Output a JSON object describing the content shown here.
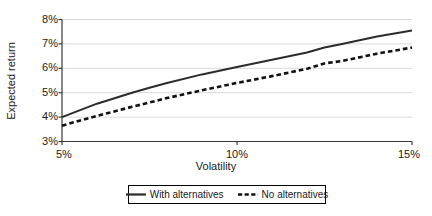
{
  "chart_data": {
    "type": "line",
    "title": "",
    "xlabel": "Volatility",
    "ylabel": "Expected return",
    "xlim": [
      5,
      15
    ],
    "ylim": [
      3,
      8
    ],
    "grid": true,
    "legend_position": "bottom",
    "x_tick_labels": [
      "5%",
      "10%",
      "15%"
    ],
    "x_ticks": [
      5,
      10,
      15
    ],
    "y_tick_labels": [
      "3%",
      "4%",
      "5%",
      "6%",
      "7%",
      "8%"
    ],
    "y_ticks": [
      3,
      4,
      5,
      6,
      7,
      8
    ],
    "x": [
      5,
      6,
      7,
      7.5,
      8,
      9,
      10,
      11,
      12,
      12.5,
      13,
      14,
      15
    ],
    "series": [
      {
        "name": "With alternatives",
        "style": "solid",
        "color": "#2b2b2b",
        "values": [
          4.0,
          4.55,
          5.0,
          5.2,
          5.4,
          5.75,
          6.05,
          6.35,
          6.65,
          6.85,
          7.0,
          7.3,
          7.55
        ]
      },
      {
        "name": "No alternatives",
        "style": "dashed",
        "color": "#111111",
        "values": [
          3.65,
          4.05,
          4.42,
          4.6,
          4.78,
          5.1,
          5.4,
          5.68,
          5.98,
          6.2,
          6.3,
          6.6,
          6.85
        ]
      }
    ]
  },
  "axes": {
    "y_title": "Expected return",
    "x_title": "Volatility"
  },
  "legend": {
    "items": [
      {
        "label": "With alternatives",
        "style": "solid"
      },
      {
        "label": "No alternatives",
        "style": "dashed"
      }
    ]
  },
  "colors": {
    "gridline": "#d9d9d9",
    "axis": "#3a3a3a",
    "series_solid": "#2b2b2b",
    "series_dashed": "#111111",
    "text": "#1a1a1a",
    "background": "#ffffff"
  }
}
